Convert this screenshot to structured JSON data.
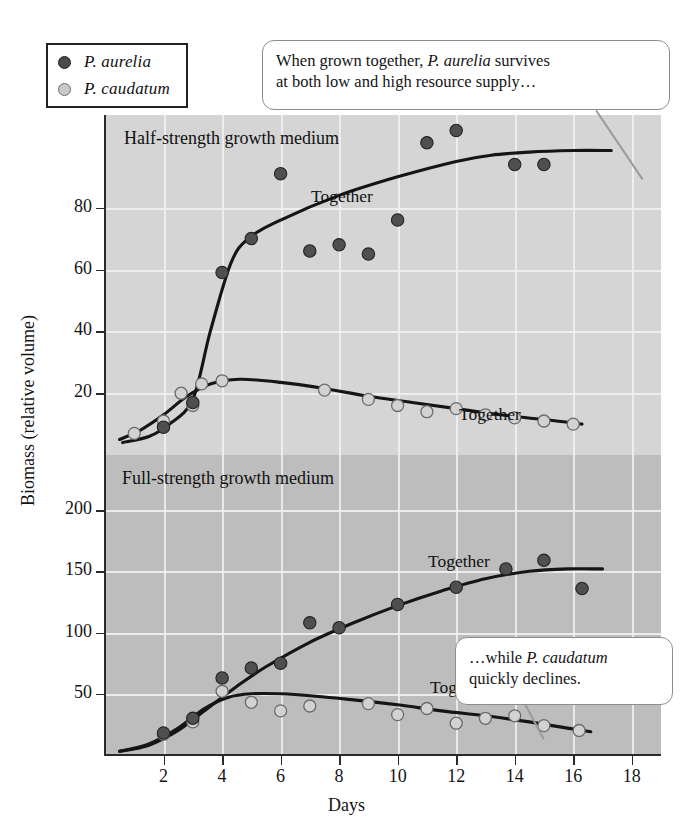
{
  "legend": {
    "items": [
      {
        "label": "P. aurelia",
        "marker": "filled-dark-circle",
        "color": "#4a4a4a"
      },
      {
        "label": "P. caudatum",
        "marker": "open-light-circle",
        "color": "#c9c9c9"
      }
    ]
  },
  "callouts": {
    "top": {
      "line1": "When grown together, P. aurelia survives",
      "line2": "at both low and high resource supply…"
    },
    "bottom": {
      "line1": "…while P. caudatum",
      "line2": "quickly declines."
    }
  },
  "chart_data": {
    "type": "scatter",
    "title": "",
    "xlabel": "Days",
    "ylabel": "Biomass (relative volume)",
    "xlim": [
      0,
      19
    ],
    "xticks": [
      2,
      4,
      6,
      8,
      10,
      12,
      14,
      16,
      18
    ],
    "grid": true,
    "legend_position": "top-left-outside",
    "panels": [
      {
        "name": "upper",
        "title": "Half-strength growth medium",
        "background": "#d5d5d5",
        "ylim": [
          0,
          110
        ],
        "yticks": [
          20,
          40,
          60,
          80
        ],
        "series": [
          {
            "name": "P. aurelia",
            "marker": "filled-dark-circle",
            "curve_label": "Together",
            "points": [
              {
                "x": 2.0,
                "y": 9
              },
              {
                "x": 3.0,
                "y": 17
              },
              {
                "x": 4.0,
                "y": 59
              },
              {
                "x": 5.0,
                "y": 70
              },
              {
                "x": 6.0,
                "y": 91
              },
              {
                "x": 7.0,
                "y": 66
              },
              {
                "x": 8.0,
                "y": 68
              },
              {
                "x": 9.0,
                "y": 65
              },
              {
                "x": 10.0,
                "y": 76
              },
              {
                "x": 11.0,
                "y": 101
              },
              {
                "x": 12.0,
                "y": 105
              },
              {
                "x": 14.0,
                "y": 94
              },
              {
                "x": 15.0,
                "y": 94
              }
            ]
          },
          {
            "name": "P. caudatum",
            "marker": "open-light-circle",
            "curve_label": "Together",
            "points": [
              {
                "x": 1.0,
                "y": 7
              },
              {
                "x": 2.0,
                "y": 11
              },
              {
                "x": 2.6,
                "y": 20
              },
              {
                "x": 3.0,
                "y": 16
              },
              {
                "x": 3.3,
                "y": 23
              },
              {
                "x": 4.0,
                "y": 24
              },
              {
                "x": 7.5,
                "y": 21
              },
              {
                "x": 9.0,
                "y": 18
              },
              {
                "x": 10.0,
                "y": 16
              },
              {
                "x": 11.0,
                "y": 14
              },
              {
                "x": 12.0,
                "y": 15
              },
              {
                "x": 13.0,
                "y": 13
              },
              {
                "x": 14.0,
                "y": 12
              },
              {
                "x": 15.0,
                "y": 11
              },
              {
                "x": 16.0,
                "y": 10
              }
            ]
          }
        ]
      },
      {
        "name": "lower",
        "title": "Full-strength growth medium",
        "background": "#bdbdbd",
        "ylim": [
          0,
          245
        ],
        "yticks": [
          50,
          100,
          150,
          200
        ],
        "series": [
          {
            "name": "P. aurelia",
            "marker": "filled-dark-circle",
            "curve_label": "Together",
            "points": [
              {
                "x": 2.0,
                "y": 18
              },
              {
                "x": 3.0,
                "y": 30
              },
              {
                "x": 4.0,
                "y": 63
              },
              {
                "x": 5.0,
                "y": 71
              },
              {
                "x": 6.0,
                "y": 75
              },
              {
                "x": 7.0,
                "y": 108
              },
              {
                "x": 8.0,
                "y": 104
              },
              {
                "x": 10.0,
                "y": 123
              },
              {
                "x": 12.0,
                "y": 137
              },
              {
                "x": 13.7,
                "y": 152
              },
              {
                "x": 15.0,
                "y": 159
              },
              {
                "x": 16.3,
                "y": 136
              }
            ]
          },
          {
            "name": "P. caudatum",
            "marker": "open-light-circle",
            "curve_label": "Together",
            "points": [
              {
                "x": 2.0,
                "y": 17
              },
              {
                "x": 3.0,
                "y": 27
              },
              {
                "x": 4.0,
                "y": 52
              },
              {
                "x": 5.0,
                "y": 43
              },
              {
                "x": 6.0,
                "y": 36
              },
              {
                "x": 7.0,
                "y": 40
              },
              {
                "x": 9.0,
                "y": 42
              },
              {
                "x": 10.0,
                "y": 33
              },
              {
                "x": 11.0,
                "y": 38
              },
              {
                "x": 12.0,
                "y": 26
              },
              {
                "x": 13.0,
                "y": 30
              },
              {
                "x": 14.0,
                "y": 32
              },
              {
                "x": 15.0,
                "y": 24
              },
              {
                "x": 16.2,
                "y": 20
              }
            ]
          }
        ]
      }
    ]
  }
}
